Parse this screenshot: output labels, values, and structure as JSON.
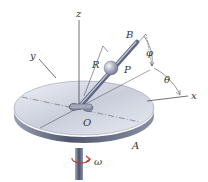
{
  "diagram": {
    "labels": {
      "z": "z",
      "y": "y",
      "x": "x",
      "B": "B",
      "R": "R",
      "P": "P",
      "phi": "φ",
      "theta": "θ",
      "O": "O",
      "A": "A",
      "omega": "ω"
    },
    "colors": {
      "disk_top": "#d7dbe6",
      "disk_edge": "#5a6178",
      "rod": "#7d869e",
      "sphere": "#a9b0c4",
      "line": "#333333",
      "omega_arrow": "#c0392b"
    }
  }
}
